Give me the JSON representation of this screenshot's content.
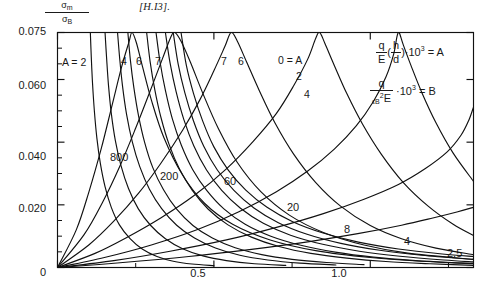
{
  "header": {
    "citation": "[H.I3]."
  },
  "axes": {
    "y_label_numerator": "σ",
    "y_label_numerator_sub": "m",
    "y_label_denominator": "σ",
    "y_label_denominator_sub": "B",
    "y_ticks": [
      "0.075",
      "0.060",
      "0.040",
      "0.020",
      "0"
    ],
    "x_ticks": [
      "0",
      "0.5",
      "1.0"
    ]
  },
  "legend": {
    "formula_a": {
      "frac_num": "q",
      "frac_den": "E",
      "paren_num": "h",
      "paren_den": "d",
      "factor": "·10",
      "exp": "3",
      "equals": "= A"
    },
    "formula_b": {
      "frac_num": "q",
      "frac_den_eps": "ϵ",
      "frac_den_sub": "B",
      "frac_den_sup": "2",
      "frac_den_e": "E",
      "factor": "·10",
      "exp": "3",
      "equals": "= B"
    }
  },
  "labels": {
    "a_first": "A = 2",
    "a_series_left": [
      "4",
      "6",
      "7"
    ],
    "a_series_right": [
      "7",
      "6"
    ],
    "a_zero": "0 = A",
    "a_two": "2",
    "a_four": "4",
    "b_series": [
      "800",
      "200",
      "60",
      "20",
      "8",
      "4",
      "2.5"
    ]
  },
  "chart_data": {
    "type": "line",
    "title": "",
    "xlabel": "",
    "ylabel": "σm/σB",
    "xlim": [
      0,
      1.33
    ],
    "ylim": [
      0,
      0.075
    ],
    "grid": false,
    "legend_position": "top-right-inside",
    "x_tick_values": [
      0,
      0.5,
      1.0
    ],
    "y_tick_values": [
      0,
      0.02,
      0.04,
      0.06,
      0.075
    ],
    "y_minor_tick_values": [
      0.005,
      0.01,
      0.015,
      0.025,
      0.03,
      0.035,
      0.045,
      0.05,
      0.055,
      0.065,
      0.07
    ],
    "x_minor_tick_values": [
      0.25,
      0.75,
      1.25
    ],
    "series": [
      {
        "name": "B = 800",
        "family": "B",
        "label": "800",
        "points": [
          [
            0,
            0
          ],
          [
            0.06,
            0.012
          ],
          [
            0.1,
            0.024
          ],
          [
            0.14,
            0.038
          ],
          [
            0.175,
            0.052
          ],
          [
            0.205,
            0.064
          ],
          [
            0.228,
            0.0718
          ],
          [
            0.238,
            0.075
          ],
          [
            0.252,
            0.0718
          ],
          [
            0.272,
            0.064
          ],
          [
            0.3,
            0.0535
          ],
          [
            0.34,
            0.0415
          ],
          [
            0.4,
            0.0295
          ],
          [
            0.47,
            0.0205
          ],
          [
            0.56,
            0.0138
          ],
          [
            0.68,
            0.0088
          ],
          [
            0.83,
            0.0053
          ],
          [
            1.0,
            0.0032
          ],
          [
            1.18,
            0.0019
          ],
          [
            1.33,
            0.0013
          ]
        ]
      },
      {
        "name": "B = 200",
        "family": "B",
        "label": "200",
        "points": [
          [
            0,
            0
          ],
          [
            0.085,
            0.0105
          ],
          [
            0.145,
            0.021
          ],
          [
            0.2,
            0.0325
          ],
          [
            0.25,
            0.0445
          ],
          [
            0.295,
            0.056
          ],
          [
            0.335,
            0.0665
          ],
          [
            0.362,
            0.0735
          ],
          [
            0.375,
            0.075
          ],
          [
            0.395,
            0.0722
          ],
          [
            0.425,
            0.0655
          ],
          [
            0.465,
            0.0555
          ],
          [
            0.515,
            0.0442
          ],
          [
            0.575,
            0.0335
          ],
          [
            0.65,
            0.0242
          ],
          [
            0.74,
            0.0168
          ],
          [
            0.85,
            0.0112
          ],
          [
            0.98,
            0.0072
          ],
          [
            1.12,
            0.0046
          ],
          [
            1.33,
            0.0026
          ]
        ]
      },
      {
        "name": "B = 60",
        "family": "B",
        "label": "60",
        "points": [
          [
            0,
            0
          ],
          [
            0.1,
            0.0072
          ],
          [
            0.18,
            0.0148
          ],
          [
            0.26,
            0.0238
          ],
          [
            0.33,
            0.0332
          ],
          [
            0.4,
            0.0438
          ],
          [
            0.455,
            0.0535
          ],
          [
            0.5,
            0.0628
          ],
          [
            0.535,
            0.0705
          ],
          [
            0.555,
            0.075
          ],
          [
            0.575,
            0.0722
          ],
          [
            0.605,
            0.0655
          ],
          [
            0.645,
            0.0565
          ],
          [
            0.695,
            0.0462
          ],
          [
            0.755,
            0.0362
          ],
          [
            0.825,
            0.0272
          ],
          [
            0.905,
            0.0196
          ],
          [
            1.0,
            0.0134
          ],
          [
            1.1,
            0.0092
          ],
          [
            1.21,
            0.0062
          ],
          [
            1.33,
            0.0041
          ]
        ]
      },
      {
        "name": "B = 20",
        "family": "B",
        "label": "20",
        "points": [
          [
            0,
            0
          ],
          [
            0.12,
            0.0045
          ],
          [
            0.22,
            0.0095
          ],
          [
            0.33,
            0.0158
          ],
          [
            0.44,
            0.0232
          ],
          [
            0.54,
            0.0315
          ],
          [
            0.625,
            0.0402
          ],
          [
            0.7,
            0.0492
          ],
          [
            0.755,
            0.058
          ],
          [
            0.8,
            0.0665
          ],
          [
            0.825,
            0.073
          ],
          [
            0.838,
            0.075
          ],
          [
            0.855,
            0.0715
          ],
          [
            0.885,
            0.0645
          ],
          [
            0.925,
            0.0555
          ],
          [
            0.975,
            0.0458
          ],
          [
            1.035,
            0.0362
          ],
          [
            1.105,
            0.0272
          ],
          [
            1.185,
            0.0196
          ],
          [
            1.265,
            0.0138
          ],
          [
            1.33,
            0.0102
          ]
        ]
      },
      {
        "name": "B = 8",
        "family": "B",
        "label": "8",
        "points": [
          [
            0,
            0
          ],
          [
            0.15,
            0.0032
          ],
          [
            0.3,
            0.0072
          ],
          [
            0.45,
            0.0122
          ],
          [
            0.58,
            0.0178
          ],
          [
            0.7,
            0.0242
          ],
          [
            0.8,
            0.0308
          ],
          [
            0.885,
            0.0378
          ],
          [
            0.955,
            0.0452
          ],
          [
            1.01,
            0.053
          ],
          [
            1.05,
            0.0608
          ],
          [
            1.075,
            0.0682
          ],
          [
            1.085,
            0.0735
          ],
          [
            1.092,
            0.075
          ],
          [
            1.105,
            0.0712
          ],
          [
            1.13,
            0.0645
          ],
          [
            1.165,
            0.0558
          ],
          [
            1.21,
            0.0462
          ],
          [
            1.265,
            0.0365
          ],
          [
            1.33,
            0.0275
          ]
        ]
      },
      {
        "name": "B = 4",
        "family": "B",
        "label": "4",
        "points": [
          [
            0,
            0
          ],
          [
            0.18,
            0.0022
          ],
          [
            0.36,
            0.0052
          ],
          [
            0.54,
            0.0088
          ],
          [
            0.7,
            0.0128
          ],
          [
            0.85,
            0.0172
          ],
          [
            0.98,
            0.0218
          ],
          [
            1.09,
            0.0265
          ],
          [
            1.175,
            0.0315
          ],
          [
            1.245,
            0.0368
          ],
          [
            1.29,
            0.0422
          ],
          [
            1.315,
            0.047
          ],
          [
            1.33,
            0.0512
          ]
        ]
      },
      {
        "name": "B = 2.5",
        "family": "B",
        "label": "2.5",
        "points": [
          [
            0,
            0
          ],
          [
            0.2,
            0.0015
          ],
          [
            0.42,
            0.0035
          ],
          [
            0.62,
            0.0058
          ],
          [
            0.8,
            0.0082
          ],
          [
            0.96,
            0.0108
          ],
          [
            1.1,
            0.0135
          ],
          [
            1.2,
            0.0158
          ],
          [
            1.28,
            0.0178
          ],
          [
            1.33,
            0.0192
          ]
        ]
      },
      {
        "name": "A = 2",
        "family": "A",
        "label": "A = 2",
        "points": [
          [
            0.105,
            0.075
          ],
          [
            0.108,
            0.0672
          ],
          [
            0.112,
            0.0588
          ],
          [
            0.118,
            0.0498
          ],
          [
            0.126,
            0.0412
          ],
          [
            0.137,
            0.0332
          ],
          [
            0.152,
            0.0258
          ],
          [
            0.172,
            0.0192
          ],
          [
            0.198,
            0.0136
          ],
          [
            0.232,
            0.0092
          ],
          [
            0.272,
            0.0058
          ],
          [
            0.318,
            0.0035
          ],
          [
            0.37,
            0.002
          ],
          [
            0.43,
            0.0011
          ],
          [
            0.5,
            0.0006
          ]
        ]
      },
      {
        "name": "A = 4",
        "family": "A",
        "label": "4",
        "points": [
          [
            0.152,
            0.075
          ],
          [
            0.157,
            0.0668
          ],
          [
            0.163,
            0.0582
          ],
          [
            0.172,
            0.0492
          ],
          [
            0.185,
            0.0405
          ],
          [
            0.203,
            0.0325
          ],
          [
            0.227,
            0.0252
          ],
          [
            0.258,
            0.0188
          ],
          [
            0.298,
            0.0134
          ],
          [
            0.345,
            0.0092
          ],
          [
            0.4,
            0.006
          ],
          [
            0.465,
            0.0037
          ],
          [
            0.54,
            0.0022
          ],
          [
            0.63,
            0.0012
          ],
          [
            0.73,
            0.0007
          ]
        ]
      },
      {
        "name": "A = 6",
        "family": "A",
        "label": "6",
        "points": [
          [
            0.192,
            0.075
          ],
          [
            0.199,
            0.0665
          ],
          [
            0.208,
            0.0578
          ],
          [
            0.221,
            0.0488
          ],
          [
            0.239,
            0.0402
          ],
          [
            0.263,
            0.0322
          ],
          [
            0.294,
            0.025
          ],
          [
            0.333,
            0.0188
          ],
          [
            0.381,
            0.0135
          ],
          [
            0.438,
            0.0094
          ],
          [
            0.505,
            0.0062
          ],
          [
            0.583,
            0.0039
          ],
          [
            0.672,
            0.0024
          ],
          [
            0.775,
            0.0014
          ],
          [
            0.89,
            0.0008
          ]
        ]
      },
      {
        "name": "A = 7 (left)",
        "family": "A",
        "label": "7",
        "points": [
          [
            0.225,
            0.075
          ],
          [
            0.233,
            0.0662
          ],
          [
            0.244,
            0.0575
          ],
          [
            0.259,
            0.0485
          ],
          [
            0.279,
            0.0398
          ],
          [
            0.305,
            0.0318
          ],
          [
            0.339,
            0.0248
          ],
          [
            0.381,
            0.0186
          ],
          [
            0.433,
            0.0134
          ],
          [
            0.495,
            0.0094
          ],
          [
            0.568,
            0.0063
          ],
          [
            0.653,
            0.0041
          ],
          [
            0.75,
            0.0026
          ],
          [
            0.86,
            0.0016
          ],
          [
            0.98,
            0.0009
          ]
        ]
      },
      {
        "name": "A = 7 (right)",
        "family": "A",
        "label": "7",
        "points": [
          [
            0.285,
            0.075
          ],
          [
            0.296,
            0.0658
          ],
          [
            0.311,
            0.0568
          ],
          [
            0.331,
            0.0478
          ],
          [
            0.357,
            0.0392
          ],
          [
            0.39,
            0.0314
          ],
          [
            0.431,
            0.0246
          ],
          [
            0.482,
            0.0186
          ],
          [
            0.545,
            0.0136
          ],
          [
            0.62,
            0.0097
          ],
          [
            0.708,
            0.0067
          ],
          [
            0.81,
            0.0045
          ],
          [
            0.925,
            0.003
          ],
          [
            1.05,
            0.0019
          ],
          [
            1.19,
            0.0012
          ],
          [
            1.33,
            0.0007
          ]
        ]
      },
      {
        "name": "A = 6 (right)",
        "family": "A",
        "label": "6",
        "points": [
          [
            0.315,
            0.075
          ],
          [
            0.328,
            0.0655
          ],
          [
            0.345,
            0.0565
          ],
          [
            0.367,
            0.0475
          ],
          [
            0.396,
            0.039
          ],
          [
            0.432,
            0.0313
          ],
          [
            0.477,
            0.0246
          ],
          [
            0.532,
            0.0187
          ],
          [
            0.6,
            0.0138
          ],
          [
            0.682,
            0.01
          ],
          [
            0.778,
            0.0071
          ],
          [
            0.888,
            0.0049
          ],
          [
            1.01,
            0.0033
          ],
          [
            1.145,
            0.0022
          ],
          [
            1.29,
            0.0014
          ],
          [
            1.33,
            0.0012
          ]
        ]
      },
      {
        "name": "A = 0",
        "family": "A",
        "label": "0 = A",
        "points": [
          [
            0.345,
            0.075
          ],
          [
            0.36,
            0.0652
          ],
          [
            0.379,
            0.0562
          ],
          [
            0.404,
            0.0472
          ],
          [
            0.436,
            0.0388
          ],
          [
            0.476,
            0.0312
          ],
          [
            0.525,
            0.0246
          ],
          [
            0.585,
            0.0189
          ],
          [
            0.658,
            0.0141
          ],
          [
            0.745,
            0.0103
          ],
          [
            0.848,
            0.0074
          ],
          [
            0.965,
            0.0052
          ],
          [
            1.095,
            0.0036
          ],
          [
            1.235,
            0.0024
          ],
          [
            1.33,
            0.0018
          ]
        ]
      },
      {
        "name": "A = 2 (right)",
        "family": "A",
        "label": "2",
        "points": [
          [
            0.37,
            0.075
          ],
          [
            0.386,
            0.0648
          ],
          [
            0.407,
            0.0558
          ],
          [
            0.434,
            0.047
          ],
          [
            0.468,
            0.0386
          ],
          [
            0.511,
            0.0311
          ],
          [
            0.564,
            0.0246
          ],
          [
            0.628,
            0.019
          ],
          [
            0.706,
            0.0143
          ],
          [
            0.798,
            0.0106
          ],
          [
            0.906,
            0.0077
          ],
          [
            1.03,
            0.0055
          ],
          [
            1.165,
            0.0039
          ],
          [
            1.31,
            0.0027
          ],
          [
            1.33,
            0.0026
          ]
        ]
      },
      {
        "name": "A = 4 (right)",
        "family": "A",
        "label": "4",
        "points": [
          [
            0.395,
            0.075
          ],
          [
            0.412,
            0.0645
          ],
          [
            0.435,
            0.0555
          ],
          [
            0.464,
            0.0468
          ],
          [
            0.5,
            0.0385
          ],
          [
            0.546,
            0.0311
          ],
          [
            0.602,
            0.0247
          ],
          [
            0.67,
            0.0192
          ],
          [
            0.752,
            0.0146
          ],
          [
            0.849,
            0.011
          ],
          [
            0.962,
            0.0081
          ],
          [
            1.09,
            0.0059
          ],
          [
            1.23,
            0.0043
          ],
          [
            1.33,
            0.0035
          ]
        ]
      }
    ]
  }
}
